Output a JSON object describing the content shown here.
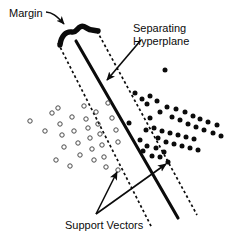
{
  "figure": {
    "type": "diagram",
    "width": 239,
    "height": 240,
    "background_color": "#ffffff",
    "ink_color": "#0b0b0b"
  },
  "labels": {
    "margin": "Margin",
    "hyperplane_line1": "Separating",
    "hyperplane_line2": "Hyperplane",
    "support_vectors": "Support Vectors"
  },
  "icons": {
    "margin_bracket": "margin-bracket-icon",
    "arrow": "arrow-icon",
    "open_circle": "open-circle-marker",
    "filled_dot": "filled-dot-marker"
  },
  "chart_data": {
    "type": "scatter",
    "xlabel": "",
    "ylabel": "",
    "grid": false,
    "legend": false,
    "xlim": [
      0,
      239
    ],
    "ylim": [
      0,
      240
    ],
    "note": "Coordinates are in image pixel space; y increases downward.",
    "series": [
      {
        "name": "Class A (open circles)",
        "marker": "open-circle",
        "marker_size": 4.4,
        "color": "#3a3a3a",
        "fill": "none",
        "points": [
          [
            30,
            121
          ],
          [
            45,
            131
          ],
          [
            52,
            113
          ],
          [
            58,
            108
          ],
          [
            60,
            124
          ],
          [
            62,
            135
          ],
          [
            64,
            147
          ],
          [
            72,
            117
          ],
          [
            74,
            131
          ],
          [
            78,
            143
          ],
          [
            80,
            155
          ],
          [
            84,
            106
          ],
          [
            86,
            119
          ],
          [
            88,
            128
          ],
          [
            90,
            138
          ],
          [
            92,
            149
          ],
          [
            94,
            160
          ],
          [
            96,
            112
          ],
          [
            98,
            124
          ],
          [
            100,
            134
          ],
          [
            102,
            145
          ],
          [
            104,
            157
          ],
          [
            106,
            167
          ],
          [
            108,
            103
          ],
          [
            112,
            118
          ],
          [
            116,
            130
          ],
          [
            118,
            142
          ],
          [
            70,
            166
          ],
          [
            56,
            160
          ],
          [
            118,
            170
          ]
        ]
      },
      {
        "name": "Class B (filled dots)",
        "marker": "filled-circle",
        "marker_size": 5.0,
        "color": "#0b0b0b",
        "fill": "#0b0b0b",
        "points": [
          [
            165,
            70
          ],
          [
            135,
            93
          ],
          [
            142,
            99
          ],
          [
            147,
            104
          ],
          [
            150,
            96
          ],
          [
            157,
            101
          ],
          [
            160,
            112
          ],
          [
            167,
            107
          ],
          [
            172,
            117
          ],
          [
            176,
            109
          ],
          [
            180,
            120
          ],
          [
            185,
            112
          ],
          [
            188,
            124
          ],
          [
            193,
            116
          ],
          [
            196,
            127
          ],
          [
            200,
            119
          ],
          [
            204,
            130
          ],
          [
            208,
            122
          ],
          [
            213,
            133
          ],
          [
            217,
            125
          ],
          [
            221,
            136
          ],
          [
            150,
            118
          ],
          [
            154,
            128
          ],
          [
            158,
            138
          ],
          [
            146,
            130
          ],
          [
            162,
            131
          ],
          [
            166,
            142
          ],
          [
            170,
            133
          ],
          [
            174,
            144
          ],
          [
            178,
            135
          ],
          [
            182,
            146
          ],
          [
            186,
            137
          ],
          [
            190,
            148
          ],
          [
            194,
            139
          ],
          [
            198,
            150
          ],
          [
            168,
            162
          ],
          [
            140,
            140
          ],
          [
            143,
            151
          ],
          [
            147,
            146
          ],
          [
            152,
            156
          ],
          [
            156,
            148
          ],
          [
            160,
            157
          ],
          [
            164,
            152
          ],
          [
            129,
            123
          ]
        ]
      }
    ],
    "lines": [
      {
        "name": "separating-hyperplane",
        "style": "solid",
        "width": 3.0,
        "color": "#0b0b0b",
        "from": [
          76,
          41
        ],
        "to": [
          178,
          218
        ]
      },
      {
        "name": "margin-boundary-left",
        "style": "dashed",
        "width": 1.6,
        "color": "#0b0b0b",
        "from": [
          58,
          43
        ],
        "to": [
          152,
          228
        ]
      },
      {
        "name": "margin-boundary-right",
        "style": "dashed",
        "width": 1.6,
        "color": "#0b0b0b",
        "from": [
          97,
          31
        ],
        "to": [
          197,
          215
        ]
      }
    ],
    "annotations": [
      {
        "name": "margin",
        "text": "Margin",
        "text_position": [
          9,
          7
        ],
        "arrow_from": [
          48,
          14
        ],
        "arrow_to": [
          68,
          28
        ],
        "points_to": "margin-bracket"
      },
      {
        "name": "separating-hyperplane",
        "text": "Separating Hyperplane",
        "text_position": [
          133,
          22
        ],
        "arrow_from": [
          140,
          41
        ],
        "arrow_to": [
          105,
          82
        ],
        "points_to": "separating-hyperplane"
      },
      {
        "name": "support-vector-left",
        "text": "Support Vectors",
        "text_position": [
          65,
          219
        ],
        "arrow_from": [
          96,
          214
        ],
        "arrow_to": [
          118,
          170
        ],
        "points_to": "open-circle-on-left-margin"
      },
      {
        "name": "support-vector-right",
        "text": "Support Vectors",
        "text_position": [
          65,
          219
        ],
        "arrow_from": [
          96,
          214
        ],
        "arrow_to": [
          168,
          162
        ],
        "points_to": "filled-dot-on-right-margin"
      }
    ],
    "margin_bracket": {
      "name": "margin-bracket",
      "style": "thick-curved-bracket",
      "width": 5.5,
      "color": "#0b0b0b",
      "path": "M 60,44 C 62,35 68,31 74,32 C 78,33 79,27 83,26 C 87,25 88,30 93,30 L 98,31"
    }
  }
}
